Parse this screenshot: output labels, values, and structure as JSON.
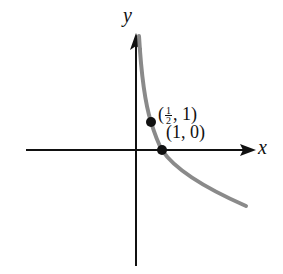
{
  "axes": {
    "x_label": "x",
    "y_label": "y"
  },
  "curve": {
    "description": "decreasing logarithmic curve (base 1/2)",
    "color": "#8a8a8a"
  },
  "points": [
    {
      "label_open": "(",
      "frac_num": "1",
      "frac_den": "2",
      "label_rest": ", 1)",
      "x": 0.5,
      "y": 1
    },
    {
      "label": "(1, 0)",
      "x": 1,
      "y": 0
    }
  ]
}
